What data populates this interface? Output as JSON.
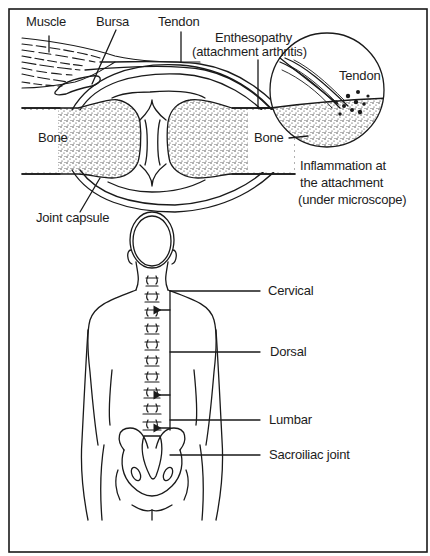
{
  "figure": {
    "top_panel": {
      "labels": {
        "muscle": "Muscle",
        "bursa": "Bursa",
        "tendon": "Tendon",
        "enthesopathy_line1": "Enthesopathy",
        "enthesopathy_line2": "(attachment arthritis)",
        "bone_left": "Bone",
        "joint_capsule": "Joint capsule"
      },
      "inset": {
        "tendon": "Tendon",
        "bone": "Bone",
        "caption_line1": "Inflammation at",
        "caption_line2": "the attachment",
        "caption_line3": "(under microscope)"
      }
    },
    "bottom_panel": {
      "labels": {
        "cervical": "Cervical",
        "dorsal": "Dorsal",
        "lumbar": "Lumbar",
        "sacroiliac": "Sacroiliac joint"
      }
    },
    "colors": {
      "ink": "#1a1a1a",
      "paper": "#ffffff"
    }
  }
}
